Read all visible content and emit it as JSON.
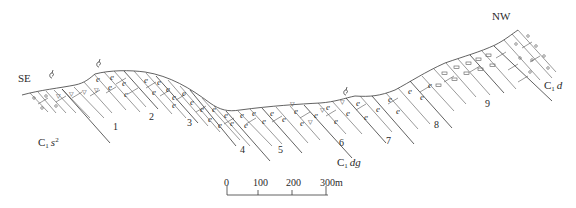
{
  "diagram": {
    "type": "geological-cross-section",
    "orientation": {
      "left": "SE",
      "right": "NW"
    },
    "formations": [
      {
        "code": "C",
        "sub": "1",
        "name": "s",
        "sup": "2",
        "position": "left"
      },
      {
        "code": "C",
        "sub": "1",
        "name": "dg",
        "sup": "",
        "position": "center"
      },
      {
        "code": "C",
        "sub": "1",
        "name": "d",
        "sup": "",
        "position": "right"
      }
    ],
    "layer_numbers": [
      "1",
      "2",
      "3",
      "4",
      "5",
      "6",
      "7",
      "8",
      "9"
    ],
    "fossil_symbols": 3,
    "scale_bar": {
      "ticks": [
        "0",
        "100",
        "200",
        "300m"
      ],
      "unit": "m"
    },
    "lithology_symbols": [
      "calcite-vein-e",
      "triangle-chert",
      "oval-nodule",
      "double-dash-clast",
      "circle-oolite"
    ]
  }
}
